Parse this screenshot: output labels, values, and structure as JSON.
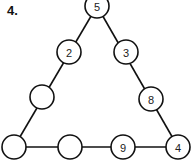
{
  "problem_number": "4.",
  "nodes": [
    {
      "id": "top",
      "x": 97,
      "y": 6,
      "value": "5"
    },
    {
      "id": "left-1",
      "x": 69,
      "y": 52,
      "value": "2"
    },
    {
      "id": "right-1",
      "x": 126,
      "y": 52,
      "value": "3"
    },
    {
      "id": "left-2",
      "x": 42,
      "y": 97,
      "value": ""
    },
    {
      "id": "right-2",
      "x": 151,
      "y": 99,
      "value": "8"
    },
    {
      "id": "bottom-left",
      "x": 14,
      "y": 147,
      "value": ""
    },
    {
      "id": "bottom-2",
      "x": 70,
      "y": 147,
      "value": ""
    },
    {
      "id": "bottom-3",
      "x": 123,
      "y": 147,
      "value": "9"
    },
    {
      "id": "bottom-right",
      "x": 178,
      "y": 147,
      "value": "4"
    }
  ]
}
